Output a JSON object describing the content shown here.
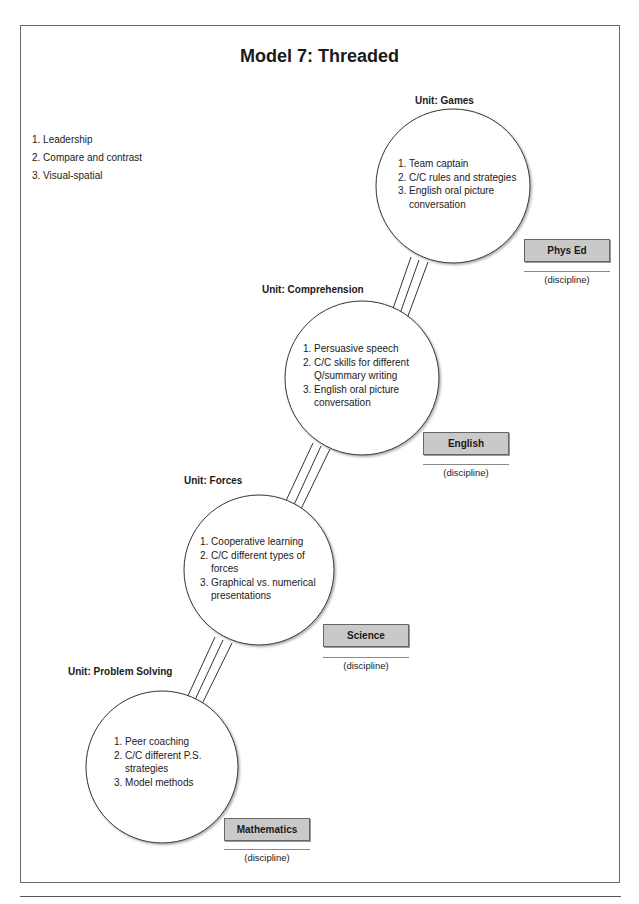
{
  "page": {
    "title": "Model 7: Threaded"
  },
  "threads": [
    {
      "label": "1. Leadership"
    },
    {
      "label": "2. Compare and contrast"
    },
    {
      "label": "3. Visual-spatial"
    }
  ],
  "units": [
    {
      "unit_label": "Unit: Games",
      "discipline": "Phys Ed",
      "discipline_caption": "(discipline)",
      "items": [
        "1. Team captain",
        "2. C/C rules and strategies",
        "3. English oral picture conversation"
      ]
    },
    {
      "unit_label": "Unit: Comprehension",
      "discipline": "English",
      "discipline_caption": "(discipline)",
      "items": [
        "1. Persuasive speech",
        "2. C/C skills for different Q/summary writing",
        "3. English oral picture conversation"
      ]
    },
    {
      "unit_label": "Unit: Forces",
      "discipline": "Science",
      "discipline_caption": "(discipline)",
      "items": [
        "1. Cooperative learning",
        "2. C/C different types of forces",
        "3. Graphical vs. numerical presentations"
      ]
    },
    {
      "unit_label": "Unit: Problem Solving",
      "discipline": "Mathematics",
      "discipline_caption": "(discipline)",
      "items": [
        "1. Peer coaching",
        "2. C/C different P.S. strategies",
        "3. Model methods"
      ]
    }
  ],
  "colors": {
    "discipline_box_fill": "#c9c9c9",
    "line": "#333333"
  }
}
